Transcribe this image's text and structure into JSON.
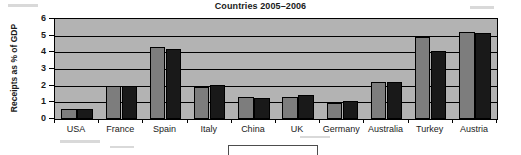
{
  "chart_data": {
    "type": "bar",
    "title": "Countries 2005–2006",
    "xlabel": "",
    "ylabel": "Receipts as % of GDP",
    "categories": [
      "USA",
      "France",
      "Spain",
      "Italy",
      "China",
      "UK",
      "Germany",
      "Australia",
      "Turkey",
      "Austria"
    ],
    "series": [
      {
        "name": "2005",
        "color": "#7d7d7d",
        "values": [
          0.6,
          2.0,
          4.35,
          1.95,
          1.3,
          1.35,
          0.95,
          2.2,
          4.9,
          5.2
        ]
      },
      {
        "name": "2006",
        "color": "#191919",
        "values": [
          0.6,
          2.0,
          4.2,
          2.05,
          1.25,
          1.45,
          1.1,
          2.2,
          4.1,
          5.15
        ]
      }
    ],
    "ylim": [
      0,
      6
    ],
    "yticks": [
      "0",
      "1",
      "2",
      "3",
      "4",
      "5",
      "6"
    ],
    "grid": true,
    "legend_position": "bottom",
    "legend_entries": []
  },
  "colors": {
    "plot_background": "#b3b3b3",
    "axis": "#000000",
    "text": "#1a1a1a",
    "series_light": "#7d7d7d",
    "series_dark": "#191919"
  }
}
